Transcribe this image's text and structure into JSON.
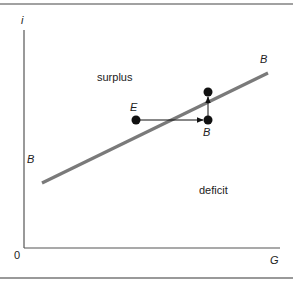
{
  "diagram": {
    "axes": {
      "y_label": "i",
      "x_label": "G",
      "origin_label": "0"
    },
    "curve": {
      "name": "BB",
      "left_label": "B",
      "right_label": "B",
      "color": "#7a7a7a"
    },
    "points": {
      "equilibrium_label": "E",
      "shifted_label": "B"
    },
    "regions": {
      "above": "surplus",
      "below": "deficit"
    },
    "colors": {
      "axis": "#555555",
      "frame": "#444444",
      "bottom_rule": "#999999",
      "text": "#222222"
    }
  }
}
